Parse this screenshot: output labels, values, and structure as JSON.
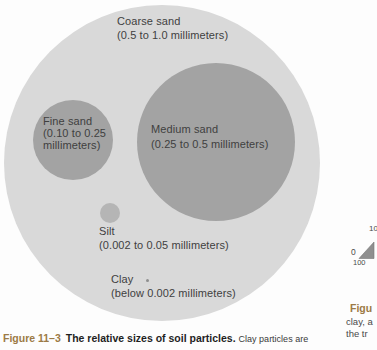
{
  "figure": {
    "particles": {
      "coarse": {
        "label": "Coarse sand",
        "size": "(0.5 to 1.0 millimeters)"
      },
      "medium": {
        "label": "Medium sand",
        "size": "(0.25 to 0.5 millimeters)"
      },
      "fine": {
        "label": "Fine sand",
        "size_line1": "(0.10 to 0.25",
        "size_line2": "millimeters)"
      },
      "silt": {
        "label": "Silt",
        "size": "(0.002 to 0.05 millimeters)"
      },
      "clay": {
        "label": "Clay",
        "size": "(below 0.002 millimeters)"
      }
    },
    "colors": {
      "coarse_circle": "#d9d9d9",
      "sand_circle": "#a3a3a3",
      "silt_circle": "#b5b5b5",
      "clay_dot": "#8e8e8e",
      "caption_accent": "#9c7a45"
    }
  },
  "caption": {
    "figure_number": "Figure 11–3",
    "title": "The relative sizes of soil particles.",
    "continuation": "Clay particles are"
  },
  "adjacent_fragment": {
    "tick_10": "10",
    "tick_0": "0",
    "tick_100": "100",
    "caption_line1": "Figu",
    "caption_line2": "clay, a",
    "caption_line3": "the tr"
  }
}
